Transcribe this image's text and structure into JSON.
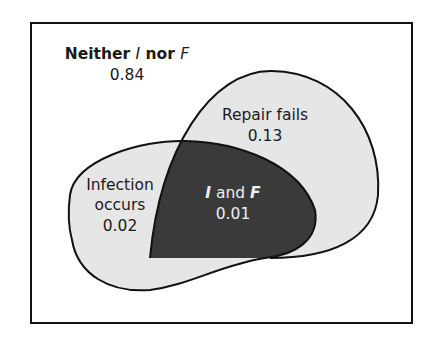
{
  "diagram": {
    "type": "venn",
    "regions": {
      "neither": {
        "label_prefix": "Neither ",
        "label_i": "I",
        "label_mid": " nor ",
        "label_f": "F",
        "value": "0.84"
      },
      "repair_fails": {
        "label": "Repair fails",
        "value": "0.13"
      },
      "infection_occurs": {
        "label_line1": "Infection",
        "label_line2": "occurs",
        "value": "0.02"
      },
      "intersection": {
        "label_i": "I",
        "label_mid": " and ",
        "label_f": "F",
        "value": "0.01"
      }
    },
    "colors": {
      "frame": "#111111",
      "light_fill": "#e6e6e6",
      "intersection_fill": "#3a3a3a",
      "intersection_text": "#eeeeee",
      "text": "#1a1a1a"
    }
  }
}
